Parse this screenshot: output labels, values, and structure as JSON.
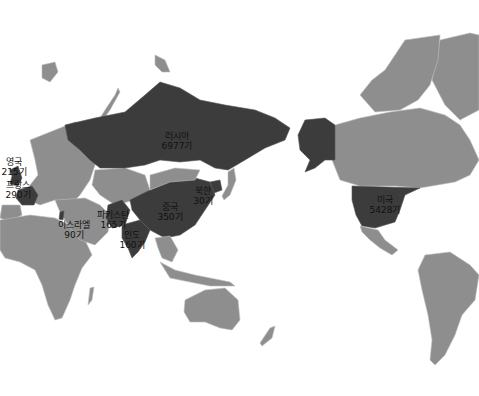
{
  "map": {
    "title": "",
    "legend": {
      "nuclear_state_color": "#3c3c3c",
      "other_land_color": "#8e8e8e",
      "ocean_color": "#ffffff"
    },
    "countries": [
      {
        "id": "russia",
        "name": "러시아",
        "count": "6977기"
      },
      {
        "id": "usa",
        "name": "미국",
        "count": "5428기"
      },
      {
        "id": "china",
        "name": "중국",
        "count": "350기"
      },
      {
        "id": "france",
        "name": "프랑스",
        "count": "290기"
      },
      {
        "id": "uk",
        "name": "영국",
        "count": "215기"
      },
      {
        "id": "pakistan",
        "name": "파키스탄",
        "count": "165기"
      },
      {
        "id": "india",
        "name": "인도",
        "count": "160기"
      },
      {
        "id": "israel",
        "name": "이스라엘",
        "count": "90기"
      },
      {
        "id": "northkorea",
        "name": "북한",
        "count": "30기"
      }
    ]
  }
}
